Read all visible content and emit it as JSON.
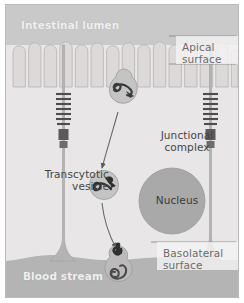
{
  "figure": {
    "type": "biological-diagram"
  },
  "labels": {
    "lumen": "Intestinal lumen",
    "blood_stream": "Blood stream",
    "apical_surface": "Apical\nsurface",
    "basolateral_surface": "Basolateral\nsurface",
    "junctional_complex": "Junctional\ncomplex",
    "transcytotic_vesicle": "Transcytotic\nvesicle",
    "nucleus": "Nucleus"
  },
  "colors": {
    "frame_border": "#b9b9b9",
    "lumen_background": "#c9c9c9",
    "cytoplasm": "#e8e6e6",
    "microvilli": "#dedbdb",
    "blood_stream": "#b4b4b4",
    "nucleus_fill": "#a9a9a9",
    "vesicle_fill": "#c4c4c4",
    "cargo_dark": "#3a3a3a",
    "cell_boundary": "#a6a6a6",
    "callout_line": "#8a8a8a",
    "label_light": "#efefef",
    "label_dark": "#454545"
  },
  "structures": {
    "microvilli_count": 15,
    "cell_boundaries": 2,
    "junctional_complex_rungs": 9,
    "vesicles": [
      {
        "name": "endocytic-vesicle-apical",
        "stage": "endocytosis",
        "cx": 118,
        "cy": 104
      },
      {
        "name": "transcytotic-vesicle-mid",
        "stage": "transport",
        "cx": 98,
        "cy": 180
      },
      {
        "name": "exocytic-vesicle-basal",
        "stage": "exocytosis",
        "cx": 113,
        "cy": 259
      }
    ],
    "arrows": [
      {
        "name": "arrow-apical-to-mid",
        "from": "endocytic-vesicle-apical",
        "to": "transcytotic-vesicle-mid"
      },
      {
        "name": "arrow-mid-to-basal",
        "from": "transcytotic-vesicle-mid",
        "to": "exocytic-vesicle-basal"
      }
    ]
  }
}
